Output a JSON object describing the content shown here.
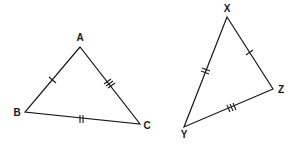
{
  "diagram": {
    "type": "congruent-triangles",
    "triangles": [
      {
        "name": "ABC",
        "vertices": [
          {
            "label": "A",
            "x": 80,
            "y": 47,
            "lx": 80,
            "ly": 41
          },
          {
            "label": "B",
            "x": 25,
            "y": 112,
            "lx": 16,
            "ly": 116
          },
          {
            "label": "C",
            "x": 140,
            "y": 124,
            "lx": 147,
            "ly": 129
          }
        ],
        "sides": [
          {
            "from": "A",
            "to": "B",
            "ticks": 1
          },
          {
            "from": "A",
            "to": "C",
            "ticks": 3
          },
          {
            "from": "B",
            "to": "C",
            "ticks": 2
          }
        ]
      },
      {
        "name": "XYZ",
        "vertices": [
          {
            "label": "X",
            "x": 227,
            "y": 17,
            "lx": 227,
            "ly": 12
          },
          {
            "label": "Y",
            "x": 184,
            "y": 127,
            "lx": 184,
            "ly": 138
          },
          {
            "label": "Z",
            "x": 273,
            "y": 89,
            "lx": 281,
            "ly": 93
          }
        ],
        "sides": [
          {
            "from": "X",
            "to": "Z",
            "ticks": 1
          },
          {
            "from": "X",
            "to": "Y",
            "ticks": 2
          },
          {
            "from": "Y",
            "to": "Z",
            "ticks": 3
          }
        ]
      }
    ],
    "labels": {
      "A": "A",
      "B": "B",
      "C": "C",
      "X": "X",
      "Y": "Y",
      "Z": "Z"
    }
  }
}
